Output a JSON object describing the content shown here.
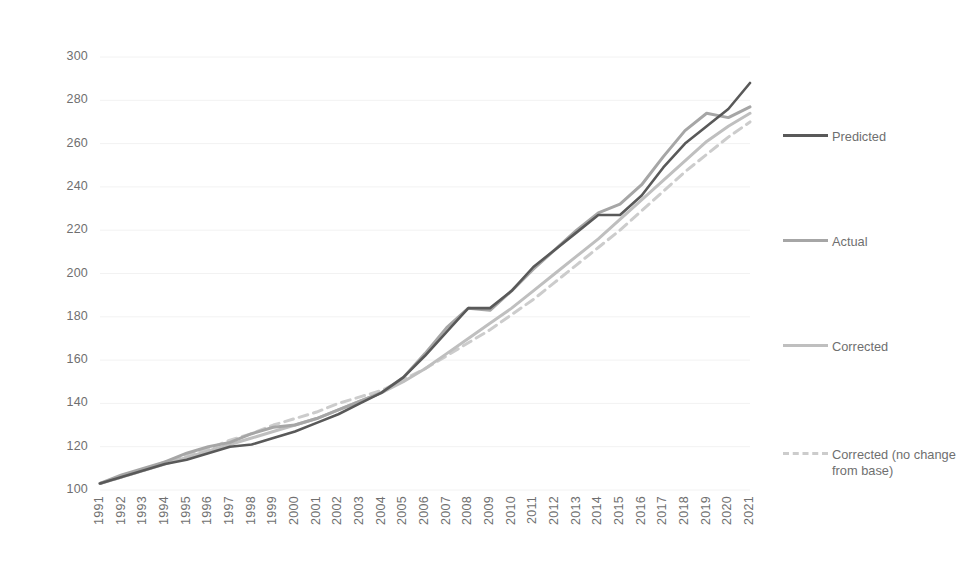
{
  "chart_data": {
    "type": "line",
    "title": "",
    "xlabel": "",
    "ylabel": "",
    "xlim": [
      1991,
      2021
    ],
    "ylim": [
      100,
      300
    ],
    "ytick_step": 20,
    "grid": true,
    "legend_position": "right",
    "categories": [
      1991,
      1992,
      1993,
      1994,
      1995,
      1996,
      1997,
      1998,
      1999,
      2000,
      2001,
      2002,
      2003,
      2004,
      2005,
      2006,
      2007,
      2008,
      2009,
      2010,
      2011,
      2012,
      2013,
      2014,
      2015,
      2016,
      2017,
      2018,
      2019,
      2020,
      2021
    ],
    "yticks": [
      100,
      120,
      140,
      160,
      180,
      200,
      220,
      240,
      260,
      280,
      300
    ],
    "xticks": [
      "1991",
      "1992",
      "1993",
      "1994",
      "1995",
      "1996",
      "1997",
      "1998",
      "1999",
      "2000",
      "2001",
      "2002",
      "2003",
      "2004",
      "2005",
      "2006",
      "2007",
      "2008",
      "2009",
      "2010",
      "2011",
      "2012",
      "2013",
      "2014",
      "2015",
      "2016",
      "2017",
      "2018",
      "2019",
      "2020",
      "2021"
    ],
    "series": [
      {
        "name": "Predicted",
        "color": "#595959",
        "style": "solid",
        "width": 2.6,
        "values": [
          103,
          106,
          109,
          112,
          114,
          117,
          120,
          121,
          124,
          127,
          131,
          135,
          140,
          145,
          152,
          162,
          173,
          184,
          184,
          192,
          203,
          211,
          219,
          227,
          227,
          236,
          249,
          260,
          268,
          276,
          288
        ]
      },
      {
        "name": "Actual",
        "color": "#a6a6a6",
        "style": "solid",
        "width": 3.0,
        "values": [
          103,
          107,
          110,
          113,
          117,
          120,
          122,
          126,
          129,
          130,
          133,
          137,
          141,
          145,
          152,
          163,
          175,
          184,
          183,
          192,
          202,
          211,
          220,
          228,
          232,
          241,
          254,
          266,
          274,
          272,
          277
        ]
      },
      {
        "name": "Corrected",
        "color": "#bfbfbf",
        "style": "solid",
        "width": 3.0,
        "values": [
          103,
          106,
          109,
          112,
          115,
          118,
          121,
          124,
          127,
          130,
          133,
          137,
          141,
          145,
          150,
          156,
          163,
          170,
          177,
          184,
          192,
          200,
          208,
          216,
          225,
          234,
          243,
          252,
          261,
          268,
          274
        ]
      },
      {
        "name": "Corrected (no change from base)",
        "color": "#cccccc",
        "style": "dashed",
        "width": 3.0,
        "values": [
          103,
          106,
          109,
          113,
          116,
          119,
          123,
          126,
          130,
          133,
          136,
          140,
          143,
          146,
          151,
          156,
          162,
          168,
          174,
          181,
          188,
          196,
          204,
          212,
          220,
          229,
          238,
          247,
          255,
          263,
          270
        ]
      }
    ]
  },
  "legend": {
    "entries": [
      {
        "label": "Predicted"
      },
      {
        "label": "Actual"
      },
      {
        "label": "Corrected"
      },
      {
        "label": "Corrected (no change from base)"
      }
    ]
  },
  "axes": {
    "y_axis_name": "value-axis",
    "x_axis_name": "year-axis"
  }
}
